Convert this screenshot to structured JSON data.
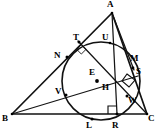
{
  "figure": {
    "stroke_color": "#111111",
    "background_color": "#ffffff",
    "labels": {
      "A": "A",
      "B": "B",
      "C": "C",
      "E": "E",
      "H": "H",
      "L": "L",
      "M": "M",
      "N": "N",
      "R": "R",
      "S": "S",
      "T": "T",
      "U": "U",
      "V": "V",
      "W": "W"
    },
    "points": {
      "A": {
        "x": 112,
        "y": 13
      },
      "B": {
        "x": 12,
        "y": 114
      },
      "C": {
        "x": 147,
        "y": 114
      },
      "E": {
        "x": 97,
        "y": 81
      },
      "H": {
        "x": 112,
        "y": 91
      },
      "L": {
        "x": 92,
        "y": 119
      },
      "M": {
        "x": 132,
        "y": 66
      },
      "N": {
        "x": 67,
        "y": 57
      },
      "R": {
        "x": 117,
        "y": 114
      },
      "S": {
        "x": 134,
        "y": 80
      },
      "T": {
        "x": 81,
        "y": 44
      },
      "U": {
        "x": 108,
        "y": 48
      },
      "V": {
        "x": 66,
        "y": 95
      },
      "W": {
        "x": 127,
        "y": 96
      }
    },
    "label_positions": {
      "A": {
        "x": 107,
        "y": 0
      },
      "B": {
        "x": 3,
        "y": 114
      },
      "C": {
        "x": 148,
        "y": 114
      },
      "E": {
        "x": 90,
        "y": 70
      },
      "H": {
        "x": 103,
        "y": 84
      },
      "L": {
        "x": 87,
        "y": 121
      },
      "M": {
        "x": 131,
        "y": 55
      },
      "N": {
        "x": 55,
        "y": 53
      },
      "R": {
        "x": 113,
        "y": 121
      },
      "S": {
        "x": 136,
        "y": 68
      },
      "T": {
        "x": 74,
        "y": 34
      },
      "U": {
        "x": 103,
        "y": 34
      },
      "V": {
        "x": 56,
        "y": 88
      },
      "W": {
        "x": 128,
        "y": 97
      }
    },
    "circle": {
      "cx": 101,
      "cy": 81,
      "r": 39
    },
    "segments": [
      {
        "name": "side-AB",
        "from": "A",
        "to": "B"
      },
      {
        "name": "side-BC",
        "from": "B",
        "to": "C"
      },
      {
        "name": "side-AC",
        "from": "A",
        "to": "C"
      },
      {
        "name": "altitude-A-R",
        "from": "A",
        "to": "R"
      },
      {
        "name": "cevian-B-S",
        "from": "B",
        "to": "S"
      },
      {
        "name": "cevian-T-W-C",
        "from": "T",
        "to": "C"
      },
      {
        "name": "segment-A-M",
        "from": "A",
        "to": "M"
      }
    ],
    "right_angles": [
      {
        "name": "right-angle-at-T",
        "x": 81,
        "y": 49
      },
      {
        "name": "right-angle-at-S",
        "x": 131,
        "y": 79
      },
      {
        "name": "right-angle-at-R",
        "x": 112,
        "y": 110
      }
    ],
    "marked_points": [
      "E",
      "N",
      "T",
      "V",
      "L",
      "R",
      "W",
      "M",
      "S",
      "U",
      "H"
    ]
  }
}
